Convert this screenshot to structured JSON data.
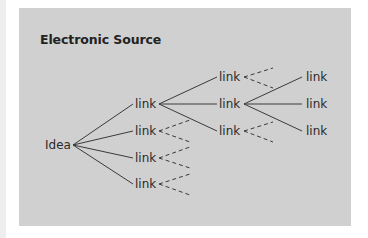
{
  "title": "Electronic Source",
  "root": {
    "label": "Idea"
  },
  "level1": [
    {
      "label": "link"
    },
    {
      "label": "link"
    },
    {
      "label": "link"
    },
    {
      "label": "link"
    }
  ],
  "level2": [
    {
      "label": "link"
    },
    {
      "label": "link"
    },
    {
      "label": "link"
    }
  ],
  "level3": [
    {
      "label": "link"
    },
    {
      "label": "link"
    },
    {
      "label": "link"
    }
  ],
  "colors": {
    "panel": "#d0d0d0",
    "line": "#3a3a3a",
    "text": "#2a2a2a"
  }
}
